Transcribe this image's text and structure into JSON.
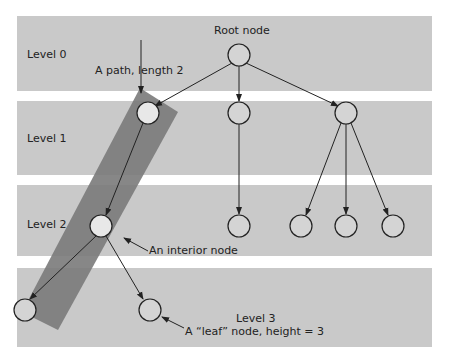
{
  "diagram": {
    "levels": [
      {
        "label": "Level 0"
      },
      {
        "label": "Level 1"
      },
      {
        "label": "Level 2"
      },
      {
        "label": "Level 3"
      }
    ],
    "annotations": {
      "root": "Root node",
      "path": "A path, length 2",
      "interior": "An interior node",
      "leaf": "A “leaf” node, height = 3"
    },
    "colors": {
      "band": "#c9c9c9",
      "path_highlight": "#7a7a7a",
      "node_fill": "#d4d4d4",
      "stroke": "#222222"
    }
  }
}
